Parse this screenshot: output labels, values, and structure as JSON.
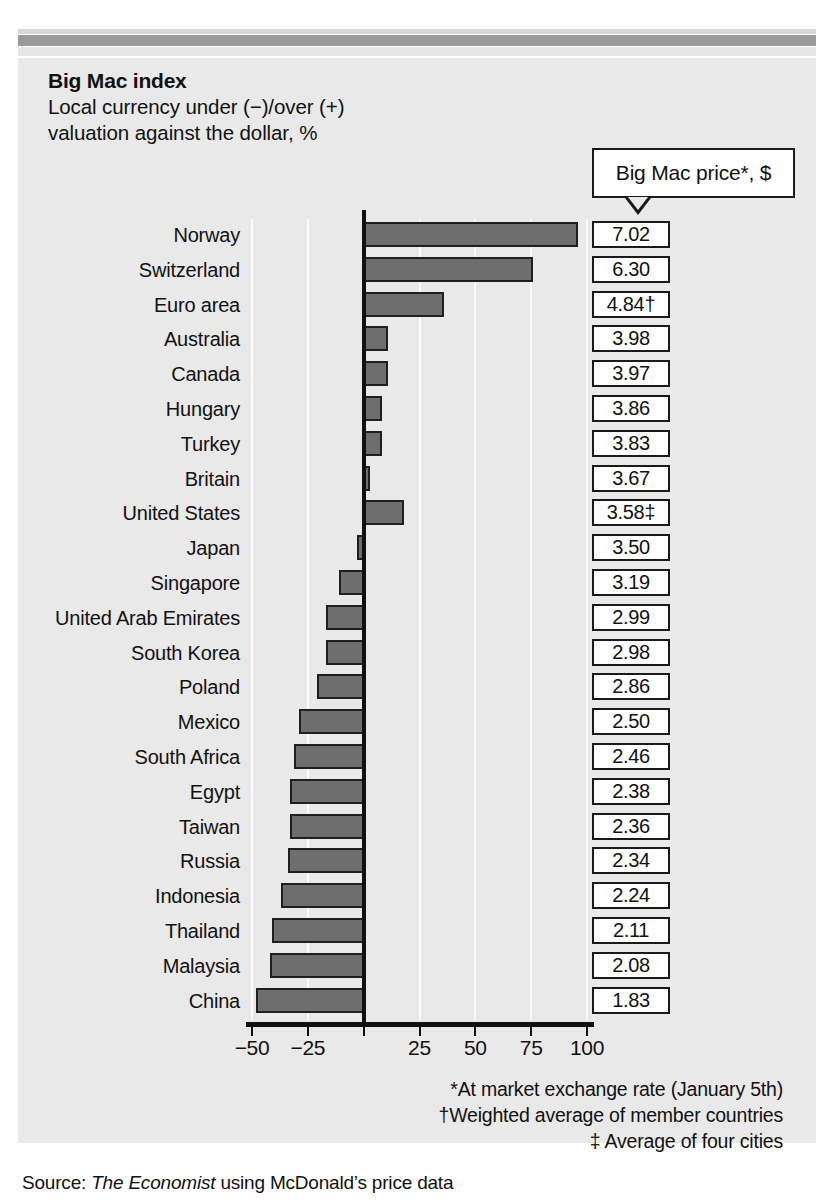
{
  "header": {
    "title": "Big Mac index",
    "subtitle_line1": "Local currency under (−)/over (+)",
    "subtitle_line2": "valuation against the dollar, %"
  },
  "price_callout": {
    "label": "Big Mac price*, $"
  },
  "footnotes": {
    "asterisk": "*At market exchange rate (January 5th)",
    "dagger": "†Weighted average of member countries",
    "double_dagger": "‡ Average of four cities"
  },
  "source": {
    "prefix": "Source: ",
    "publication": "The Economist",
    "suffix": " using McDonald’s price data"
  },
  "colors": {
    "bar_fill": "#6e6e6e",
    "bar_stroke": "#1f1f1f",
    "panel_bg": "#e9e9e9",
    "gridline": "#fafafa",
    "axis": "#111111"
  },
  "chart_data": {
    "type": "bar",
    "orientation": "horizontal",
    "title": "Big Mac index",
    "subtitle": "Local currency under (−)/over (+) valuation against the dollar, %",
    "xlabel": "",
    "ylabel": "",
    "xlim": [
      -50,
      100
    ],
    "grid": true,
    "legend": null,
    "xticks": [
      -50,
      -25,
      0,
      25,
      50,
      75,
      100
    ],
    "xtick_labels": [
      "−50",
      "−25",
      "",
      "25",
      "50",
      "75",
      "100"
    ],
    "categories": [
      "Norway",
      "Switzerland",
      "Euro area",
      "Australia",
      "Canada",
      "Hungary",
      "Turkey",
      "Britain",
      "United States",
      "Japan",
      "Singapore",
      " United Arab Emirates",
      "South Korea",
      "Poland",
      "Mexico",
      "South Africa",
      "Egypt",
      "Taiwan",
      "Russia",
      "Indonesia",
      "Thailand",
      "Malaysia",
      "China"
    ],
    "values": [
      96,
      76,
      36,
      11,
      11,
      8,
      8,
      3,
      18,
      -3,
      -11,
      -17,
      -17,
      -21,
      -29,
      -31,
      -33,
      -33,
      -34,
      -37,
      -41,
      -42,
      -48
    ],
    "secondary_series": {
      "name": "Big Mac price*, $",
      "values": [
        "7.02",
        "6.30",
        "4.84†",
        "3.98",
        "3.97",
        "3.86",
        "3.83",
        "3.67",
        "3.58‡",
        "3.50",
        "3.19",
        "2.99",
        "2.98",
        "2.86",
        "2.50",
        "2.46",
        "2.38",
        "2.36",
        "2.34",
        "2.24",
        "2.11",
        "2.08",
        "1.83"
      ]
    }
  }
}
